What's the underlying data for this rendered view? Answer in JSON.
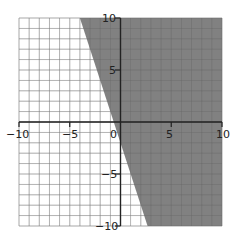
{
  "chart_data": {
    "type": "area",
    "title": "",
    "xlabel": "",
    "ylabel": "",
    "xlim": [
      -10,
      10
    ],
    "ylim": [
      -10,
      10
    ],
    "grid": true,
    "grid_step": 1,
    "x_ticks": [
      "-10",
      "-5",
      "0",
      "5",
      "10"
    ],
    "y_ticks": [
      "10",
      "5",
      "-5",
      "-10"
    ],
    "boundary_line": {
      "equation": "y = -3x - 2",
      "slope": -3,
      "intercept": -2,
      "style": "solid"
    },
    "shaded_region": "y >= -3x - 2",
    "shade_color": "#7a7a7a",
    "legend": []
  },
  "labels": {
    "x_neg10": "−10",
    "x_neg5": "−5",
    "x_0": "0",
    "x_5": "5",
    "x_10": "10",
    "y_10": "10",
    "y_5": "5",
    "y_neg5": "−5",
    "y_neg10": "−10"
  }
}
